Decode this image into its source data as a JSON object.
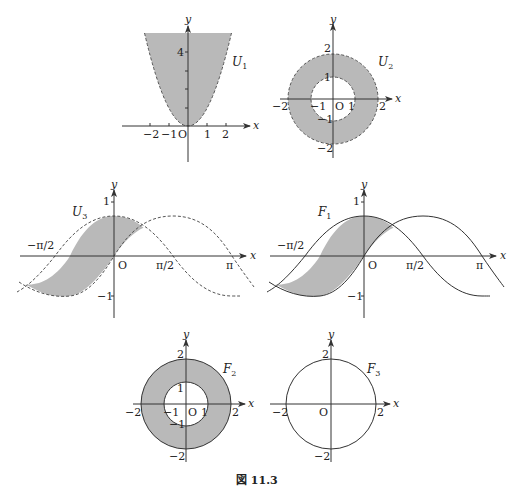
{
  "figure": {
    "caption": "図 11.3",
    "panels": [
      {
        "id": "U1",
        "name": "U",
        "subscript": "1",
        "axis_x": "x",
        "axis_y": "y",
        "origin": "O",
        "x_ticks": [
          "−2",
          "−1",
          "1",
          "2"
        ],
        "y_ticks": [
          "4"
        ],
        "description": "Open region above parabola y = x², dashed boundary, shaded"
      },
      {
        "id": "U2",
        "name": "U",
        "subscript": "2",
        "axis_x": "x",
        "axis_y": "y",
        "origin": "O",
        "x_ticks": [
          "−2",
          "−1",
          "1",
          "2"
        ],
        "y_ticks": [
          "2",
          "1",
          "−1",
          "−2"
        ],
        "description": "Open annulus 1 < x²+y² < 4, dashed boundaries, shaded"
      },
      {
        "id": "U3",
        "name": "U",
        "subscript": "3",
        "axis_x": "x",
        "axis_y": "y",
        "origin": "O",
        "x_ticks": [
          "−π/2",
          "π/2",
          "π"
        ],
        "y_ticks": [
          "1",
          "−1"
        ],
        "description": "Open region between y = sin x and y = cos x for −3π/4 < x < π/4, dashed curves, shaded"
      },
      {
        "id": "F1",
        "name": "F",
        "subscript": "1",
        "axis_x": "x",
        "axis_y": "y",
        "origin": "O",
        "x_ticks": [
          "−π/2",
          "π/2",
          "π"
        ],
        "y_ticks": [
          "1",
          "−1"
        ],
        "description": "Closed region between y = sin x and y = cos x for −3π/4 ≤ x ≤ π/4, solid curves, shaded"
      },
      {
        "id": "F2",
        "name": "F",
        "subscript": "2",
        "axis_x": "x",
        "axis_y": "y",
        "origin": "O",
        "x_ticks": [
          "−2",
          "−1",
          "1",
          "2"
        ],
        "y_ticks": [
          "2",
          "1",
          "−1",
          "−2"
        ],
        "description": "Closed annulus 1 ≤ x²+y² ≤ 4, solid boundaries, shaded"
      },
      {
        "id": "F3",
        "name": "F",
        "subscript": "3",
        "axis_x": "x",
        "axis_y": "y",
        "origin": "O",
        "x_ticks": [
          "−2",
          "2"
        ],
        "y_ticks": [
          "2",
          "−2"
        ],
        "description": "Circle x²+y² = 4, solid, unshaded"
      }
    ]
  }
}
